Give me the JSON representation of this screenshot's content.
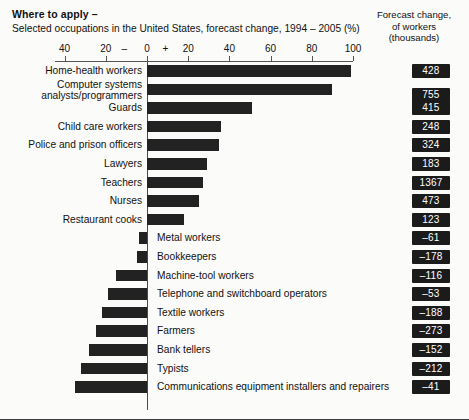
{
  "header": {
    "title": "Where to apply –",
    "subtitle": "Selected occupations in the United States, forecast change, 1994 – 2005 (%)",
    "right_line1": "Forecast change,",
    "right_line2": "of workers",
    "right_line3": "(thousands)"
  },
  "axis": {
    "tick_labels": [
      "40",
      "20",
      "–",
      "0",
      "+",
      "20",
      "40",
      "60",
      "80",
      "100"
    ],
    "tick_values": [
      -40,
      -20,
      null,
      0,
      null,
      20,
      40,
      60,
      80,
      100
    ]
  },
  "chart_data": {
    "type": "bar",
    "title": "Where to apply – Selected occupations in the United States, forecast change, 1994 – 2005 (%)",
    "xlabel": "Forecast change, 1994 – 2005 (%)",
    "ylabel": "",
    "orientation": "horizontal",
    "xlim": [
      -40,
      100
    ],
    "grid": false,
    "legend": false,
    "value_column_header": "Forecast change, of workers (thousands)",
    "categories": [
      "Home-health workers",
      "Computer systems analysts/programmers",
      "Guards",
      "Child care workers",
      "Police and prison officers",
      "Lawyers",
      "Teachers",
      "Nurses",
      "Restaurant cooks",
      "Metal workers",
      "Bookkeepers",
      "Machine-tool workers",
      "Telephone and switchboard operators",
      "Textile workers",
      "Farmers",
      "Bank tellers",
      "Typists",
      "Communications equipment installers and repairers"
    ],
    "values": [
      99,
      90,
      51,
      36,
      35,
      29,
      27,
      25,
      18,
      -4,
      -5,
      -15,
      -19,
      -22,
      -25,
      -28,
      -32,
      -35
    ],
    "workers_thousands": [
      428,
      755,
      415,
      248,
      324,
      183,
      1367,
      473,
      123,
      -61,
      -178,
      -116,
      -53,
      -188,
      -273,
      -152,
      -212,
      -41
    ]
  },
  "rows": [
    {
      "label": "Home-health workers",
      "label_line2": "",
      "pct": 99,
      "value": "428",
      "label_side": "left"
    },
    {
      "label": "Computer systems",
      "label_line2": "analysts/programmers",
      "pct": 90,
      "value": "755",
      "label_side": "left"
    },
    {
      "label": "Guards",
      "label_line2": "",
      "pct": 51,
      "value": "415",
      "label_side": "left"
    },
    {
      "label": "Child care workers",
      "label_line2": "",
      "pct": 36,
      "value": "248",
      "label_side": "left"
    },
    {
      "label": "Police and prison officers",
      "label_line2": "",
      "pct": 35,
      "value": "324",
      "label_side": "left"
    },
    {
      "label": "Lawyers",
      "label_line2": "",
      "pct": 29,
      "value": "183",
      "label_side": "left"
    },
    {
      "label": "Teachers",
      "label_line2": "",
      "pct": 27,
      "value": "1367",
      "label_side": "left"
    },
    {
      "label": "Nurses",
      "label_line2": "",
      "pct": 25,
      "value": "473",
      "label_side": "left"
    },
    {
      "label": "Restaurant cooks",
      "label_line2": "",
      "pct": 18,
      "value": "123",
      "label_side": "left"
    },
    {
      "label": "Metal workers",
      "label_line2": "",
      "pct": -4,
      "value": "–61",
      "label_side": "right"
    },
    {
      "label": "Bookkeepers",
      "label_line2": "",
      "pct": -5,
      "value": "–178",
      "label_side": "right"
    },
    {
      "label": "Machine-tool workers",
      "label_line2": "",
      "pct": -15,
      "value": "–116",
      "label_side": "right"
    },
    {
      "label": "Telephone and switchboard operators",
      "label_line2": "",
      "pct": -19,
      "value": "–53",
      "label_side": "right"
    },
    {
      "label": "Textile workers",
      "label_line2": "",
      "pct": -22,
      "value": "–188",
      "label_side": "right"
    },
    {
      "label": "Farmers",
      "label_line2": "",
      "pct": -25,
      "value": "–273",
      "label_side": "right"
    },
    {
      "label": "Bank tellers",
      "label_line2": "",
      "pct": -28,
      "value": "–152",
      "label_side": "right"
    },
    {
      "label": "Typists",
      "label_line2": "",
      "pct": -32,
      "value": "–212",
      "label_side": "right"
    },
    {
      "label": "Communications equipment installers and repairers",
      "label_line2": "",
      "pct": -35,
      "value": "–41",
      "label_side": "right"
    }
  ]
}
